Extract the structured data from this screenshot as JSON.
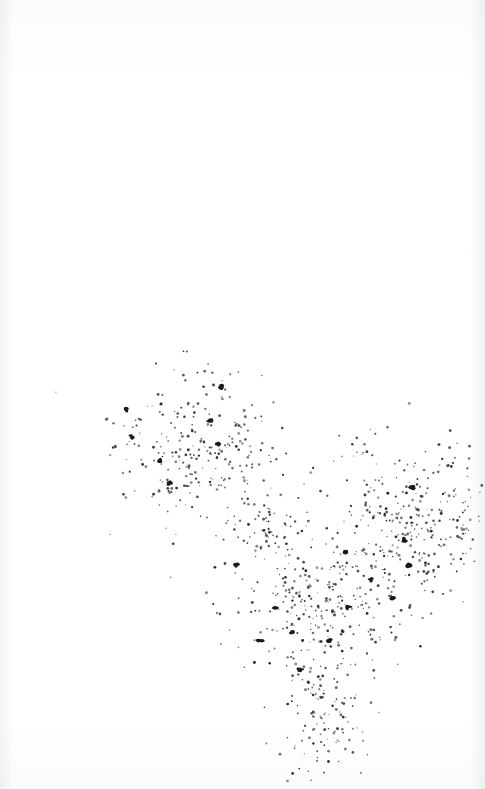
{
  "image": {
    "description": "Scanned print of a dense scatter of dark dots forming branching clusters",
    "background_color": "#ffffff",
    "dot_color": "#1a1a1a",
    "clusters": [
      {
        "name": "upper-left-cluster",
        "cx": 200,
        "cy": 450,
        "rx": 85,
        "ry": 75,
        "count": 260
      },
      {
        "name": "right-cluster",
        "cx": 410,
        "cy": 520,
        "rx": 80,
        "ry": 80,
        "count": 300
      },
      {
        "name": "middle-branch",
        "cx": 320,
        "cy": 600,
        "rx": 95,
        "ry": 60,
        "count": 260
      },
      {
        "name": "lower-stem",
        "cx": 320,
        "cy": 710,
        "rx": 45,
        "ry": 75,
        "count": 150
      },
      {
        "name": "bridge",
        "cx": 265,
        "cy": 530,
        "rx": 40,
        "ry": 30,
        "count": 60
      }
    ],
    "blobs": [
      [
        220,
        387
      ],
      [
        126,
        410
      ],
      [
        131,
        437
      ],
      [
        160,
        460
      ],
      [
        170,
        483
      ],
      [
        210,
        420
      ],
      [
        218,
        445
      ],
      [
        236,
        565
      ],
      [
        275,
        609
      ],
      [
        292,
        632
      ],
      [
        346,
        552
      ],
      [
        348,
        607
      ],
      [
        370,
        580
      ],
      [
        405,
        540
      ],
      [
        409,
        565
      ],
      [
        393,
        598
      ],
      [
        412,
        488
      ],
      [
        330,
        640
      ],
      [
        260,
        640
      ],
      [
        300,
        670
      ]
    ]
  }
}
